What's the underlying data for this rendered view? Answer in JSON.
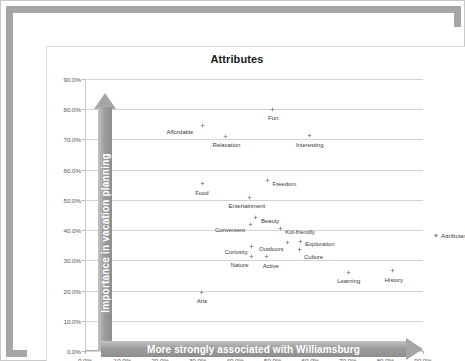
{
  "frame": {
    "nub": "resize-handle"
  },
  "legend": {
    "marker": "diamond-marker",
    "label": "Attributes"
  },
  "axis_arrows": {
    "y_label": "Importance in vacation planning",
    "x_label": "More strongly associated with Williamsburg"
  },
  "chart_data": {
    "type": "scatter",
    "title": "Attributes",
    "xlabel": "More strongly associated with Williamsburg",
    "ylabel": "Importance in vacation planning",
    "xlim": [
      0,
      90
    ],
    "ylim": [
      0,
      90
    ],
    "xticks": [
      "0.0%",
      "10.0%",
      "20.0%",
      "30.0%",
      "40.0%",
      "50.0%",
      "60.0%",
      "70.0%",
      "80.0%",
      "90.0%"
    ],
    "yticks": [
      "0.0%",
      "10.0%",
      "20.0%",
      "30.0%",
      "40.0%",
      "50.0%",
      "60.0%",
      "70.0%",
      "80.0%",
      "90.0%"
    ],
    "xtick_values": [
      0,
      10,
      20,
      30,
      40,
      50,
      60,
      70,
      80,
      90
    ],
    "ytick_values": [
      0,
      10,
      20,
      30,
      40,
      50,
      60,
      70,
      80,
      90
    ],
    "grid": "horizontal",
    "legend_position": "right",
    "series_name": "Attributes",
    "marker_color": "#8a8a8a",
    "points": [
      {
        "label": "Fun",
        "x": 49.8,
        "y": 80.0,
        "lx": -4,
        "ly": 6
      },
      {
        "label": "Affordable",
        "x": 31.3,
        "y": 74.6,
        "lx": -36,
        "ly": 3
      },
      {
        "label": "Relaxation",
        "x": 37.4,
        "y": 71.0,
        "lx": -13,
        "ly": 6
      },
      {
        "label": "Interesting",
        "x": 59.9,
        "y": 71.2,
        "lx": -14,
        "ly": 6
      },
      {
        "label": "Freedom",
        "x": 48.6,
        "y": 56.4,
        "lx": 5,
        "ly": 0
      },
      {
        "label": "Food",
        "x": 31.2,
        "y": 55.4,
        "lx": -7,
        "ly": 6
      },
      {
        "label": "Entertainment",
        "x": 43.8,
        "y": 50.8,
        "lx": -21,
        "ly": 6
      },
      {
        "label": "Beauty",
        "x": 45.5,
        "y": 44.1,
        "lx": 5,
        "ly": 0
      },
      {
        "label": "Convenient",
        "x": 44.2,
        "y": 42.0,
        "lx": -36,
        "ly": 3
      },
      {
        "label": "Kid-friendly",
        "x": 52.0,
        "y": 40.4,
        "lx": 5,
        "ly": 0
      },
      {
        "label": "Exploration",
        "x": 57.3,
        "y": 36.3,
        "lx": 5,
        "ly": 0
      },
      {
        "label": "Outdoors",
        "x": 53.8,
        "y": 36.0,
        "lx": -28,
        "ly": 4
      },
      {
        "label": "Curiosity",
        "x": 44.4,
        "y": 34.5,
        "lx": -27,
        "ly": 2
      },
      {
        "label": "Culture",
        "x": 57.0,
        "y": 33.6,
        "lx": 5,
        "ly": 5
      },
      {
        "label": "Nature",
        "x": 44.4,
        "y": 31.4,
        "lx": -21,
        "ly": 6
      },
      {
        "label": "Active",
        "x": 48.4,
        "y": 31.2,
        "lx": -4,
        "ly": 6
      },
      {
        "label": "Learning",
        "x": 70.1,
        "y": 26.0,
        "lx": -11,
        "ly": 6
      },
      {
        "label": "History",
        "x": 81.9,
        "y": 26.5,
        "lx": -8,
        "ly": 6
      },
      {
        "label": "Arts",
        "x": 31.1,
        "y": 19.5,
        "lx": -5,
        "ly": 6
      }
    ]
  }
}
